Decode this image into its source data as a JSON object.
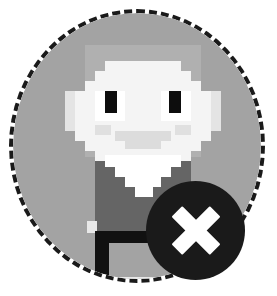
{
  "widget": {
    "type": "avatar-with-remove-badge",
    "description": "Pixel-art character avatar inside a dashed circular frame with a circular remove badge",
    "frame": {
      "shape": "circle",
      "border_style": "dashed",
      "border_color": "#1a1a1a",
      "border_width_px": 4,
      "fill_color": "#a3a3a3",
      "left_px": 9,
      "top_px": 9,
      "width_px": 256,
      "height_px": 274
    },
    "badge": {
      "name": "remove",
      "glyph": "x-icon",
      "shape": "circle",
      "fill_color": "#1a1a1a",
      "glyph_color": "#ffffff",
      "left_px": 146,
      "top_px": 181,
      "diameter_px": 99
    },
    "sprite": {
      "name": "pixel-character",
      "palette": {
        "hood": "#b0b0b0",
        "face": "#f4f4f4",
        "face_shade": "#e4e4e4",
        "sclera": "#ffffff",
        "pupil": "#0d0d0d",
        "cheek": "#e0e0e0",
        "mouth": "#dcdcdc",
        "body": "#656565",
        "beard": "#ffffff",
        "leg": "#111111",
        "foot": "#e8e8e8"
      },
      "parts": [
        "hood",
        "head",
        "left-eye",
        "right-eye",
        "left-cheek",
        "right-cheek",
        "mouth",
        "beard",
        "torso",
        "leg",
        "foot"
      ]
    }
  },
  "colors": {
    "page_background": "#ffffff",
    "disc": "#a3a3a3",
    "outline": "#1a1a1a",
    "accent_light": "#ffffff"
  }
}
